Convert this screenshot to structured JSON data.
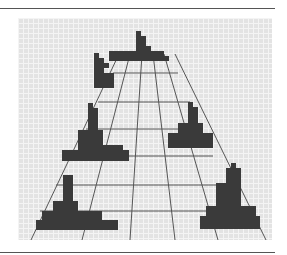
{
  "illustration": {
    "description": "Pixel-art perspective grid road with blocky dark pixel figures",
    "colors": {
      "background": "#e3e3e3",
      "gridline": "#f4f4f4",
      "lines": "#555555",
      "blocks": "#3a3a3a"
    },
    "cell_size_px": 5
  }
}
